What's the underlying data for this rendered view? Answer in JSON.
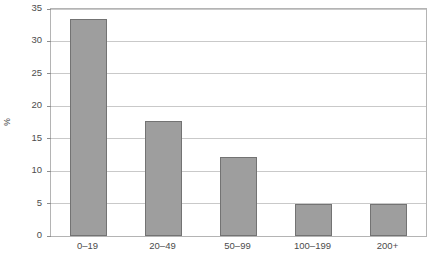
{
  "chart_data": {
    "type": "bar",
    "title": "",
    "subtitle": "",
    "xlabel": "",
    "ylabel": "%",
    "categories": [
      "0–19",
      "20–49",
      "50–99",
      "100–199",
      "200+"
    ],
    "values": [
      33.5,
      17.8,
      12.2,
      5.0,
      5.0
    ],
    "ylim": [
      0,
      35
    ],
    "yticks": [
      0,
      5,
      10,
      15,
      20,
      25,
      30,
      35
    ],
    "ytick_labels": [
      "0",
      "5",
      "10",
      "15",
      "20",
      "25",
      "30",
      "35"
    ],
    "grid": "horizontal",
    "legend": "none",
    "bar_color": "#9e9e9e",
    "bar_border_color": "#737373",
    "gridline_color": "#c9c9c9",
    "frame_color": "#b4b4b4",
    "background_color": "#ffffff",
    "annotations": []
  }
}
